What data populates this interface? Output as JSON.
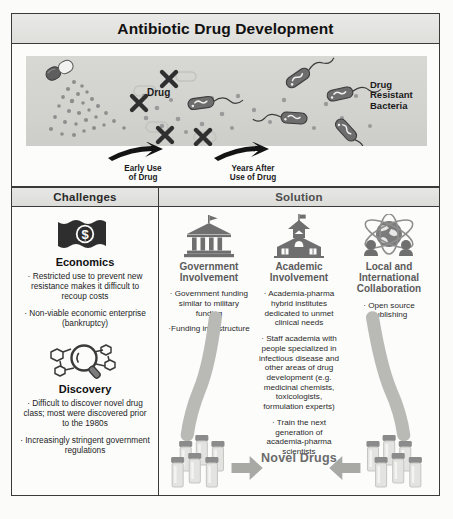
{
  "banner": {
    "title": "Antibiotic Drug Development"
  },
  "hero": {
    "drug_label": "Drug",
    "resistant_label": "Drug\nResistant\nBacteria",
    "resistant_label_lines": [
      "Drug",
      "Resistant",
      "Bacteria"
    ],
    "arrow_1": "Early Use\nof Drug",
    "arrow_1_lines": [
      "Early Use",
      "of Drug"
    ],
    "arrow_2": "Years After\nUse of Drug",
    "arrow_2_lines": [
      "Years After",
      "Use of Drug"
    ],
    "x_marks_count": 4,
    "icons": {
      "capsule": "capsule-icon",
      "bacterium": "bacterium-icon",
      "x_mark": "x-mark-icon"
    }
  },
  "challenges": {
    "header": "Challenges",
    "items": [
      {
        "icon": "dollar-bill-icon",
        "title": "Economics",
        "bullets": [
          "· Restricted use to prevent new resistance makes it difficult to recoup costs",
          "· Non-viable economic enterprise (bankruptcy)"
        ]
      },
      {
        "icon": "magnifier-molecule-icon",
        "title": "Discovery",
        "bullets": [
          "· Difficult to discover novel drug class; most were discovered prior to the 1980s",
          "· Increasingly stringent government regulations"
        ]
      }
    ]
  },
  "solution": {
    "header": "Solution",
    "columns": [
      {
        "icon": "government-building-icon",
        "title": "Government Involvement",
        "title_lines": [
          "Government",
          "Involvement"
        ],
        "bullets": [
          "· Government funding similar to military funding",
          "·Funding infrastructure"
        ]
      },
      {
        "icon": "school-building-icon",
        "title": "Academic Involvement",
        "title_lines": [
          "Academic",
          "Involvement"
        ],
        "bullets": [
          "· Academia-pharma hybrid institutes dedicated to unmet clinical needs",
          "· Staff academia with people specialized in infectious disease and other areas of drug development (e.g. medicinal chemists, toxicologists, formulation experts)",
          "· Train the next generation of academia-pharma scientists"
        ]
      },
      {
        "icon": "globe-atom-icon",
        "title": "Local and International Collaboration",
        "title_lines": [
          "Local and",
          "International",
          "Collaboration"
        ],
        "bullets": [
          "· Open source publishing"
        ]
      }
    ],
    "outcome": {
      "label": "Novel Drugs",
      "icon_left": "vial-cluster-icon",
      "icon_right": "vial-cluster-icon",
      "arrow_left": "arrow-right-icon",
      "arrow_right": "arrow-left-icon"
    }
  },
  "colors": {
    "frame": "#3a3a3a",
    "banner_bg": "#e4e4e1",
    "stage_bg": "#d4d4d1",
    "bacteria": "#6f6f6f",
    "particle": "#8a8a8a",
    "solution_title": "#5b5b5b",
    "novel_drugs": "#6b6b6b",
    "capsule_dark": "#5e5e5e",
    "capsule_light": "#f0f0ee"
  }
}
